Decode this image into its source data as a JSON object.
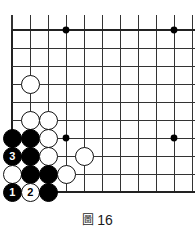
{
  "figure": {
    "caption_mark": "圖",
    "caption_number": "16",
    "caption_full": "圖 16"
  },
  "board": {
    "type": "go-board-corner",
    "description": "Upper-left corner of a Go board showing a life-and-death sequence",
    "colors": {
      "background": "#ffffff",
      "line": "#333333",
      "edge_line": "#222222",
      "black_stone": "#000000",
      "white_stone": "#ffffff",
      "stone_outline": "#111111"
    },
    "geometry": {
      "origin_x": 12,
      "origin_y": 30,
      "spacing": 18,
      "cols": 11,
      "rows": 10,
      "stone_diameter": 19
    },
    "top_partial_line_y": 15,
    "star_points": [
      {
        "col": 3,
        "row": 0
      },
      {
        "col": 9,
        "row": 0
      },
      {
        "col": 3,
        "row": 6
      },
      {
        "col": 9,
        "row": 6
      }
    ],
    "stones": [
      {
        "col": 1,
        "row": 3,
        "color": "white",
        "label": ""
      },
      {
        "col": 1,
        "row": 5,
        "color": "white",
        "label": ""
      },
      {
        "col": 2,
        "row": 5,
        "color": "white",
        "label": ""
      },
      {
        "col": 0,
        "row": 6,
        "color": "black",
        "label": ""
      },
      {
        "col": 1,
        "row": 6,
        "color": "black",
        "label": ""
      },
      {
        "col": 2,
        "row": 6,
        "color": "white",
        "label": ""
      },
      {
        "col": 0,
        "row": 7,
        "color": "black",
        "label": "3"
      },
      {
        "col": 1,
        "row": 7,
        "color": "black",
        "label": ""
      },
      {
        "col": 2,
        "row": 7,
        "color": "white",
        "label": ""
      },
      {
        "col": 4,
        "row": 7,
        "color": "white",
        "label": ""
      },
      {
        "col": 0,
        "row": 8,
        "color": "white",
        "label": ""
      },
      {
        "col": 1,
        "row": 8,
        "color": "black",
        "label": ""
      },
      {
        "col": 2,
        "row": 8,
        "color": "black",
        "label": ""
      },
      {
        "col": 3,
        "row": 8,
        "color": "white",
        "label": ""
      },
      {
        "col": 0,
        "row": 9,
        "color": "black",
        "label": "1"
      },
      {
        "col": 1,
        "row": 9,
        "color": "white",
        "label": "2"
      },
      {
        "col": 2,
        "row": 9,
        "color": "black",
        "label": ""
      }
    ]
  }
}
